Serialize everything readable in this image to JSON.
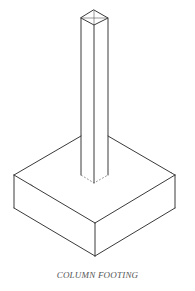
{
  "figure": {
    "caption": "COLUMN FOOTING",
    "line_color": "#3a3a3a",
    "caption_color": "#555555"
  }
}
